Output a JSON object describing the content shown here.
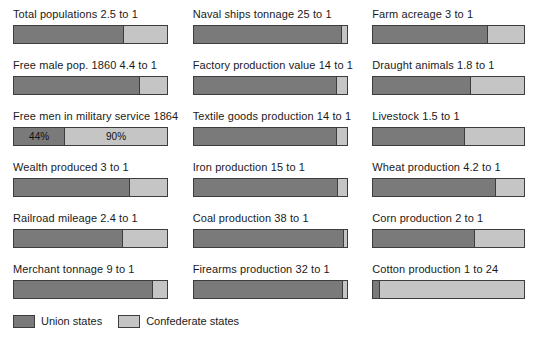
{
  "chart_data": {
    "type": "bar",
    "title": "",
    "subtitle": "",
    "xlabel": "",
    "ylabel": "",
    "orientation": "horizontal-stacked",
    "grid": false,
    "legend_position": "bottom-left",
    "legend": [
      {
        "key": "union",
        "label": "Union states",
        "color": "#7a7a7a"
      },
      {
        "key": "confederate",
        "label": "Confederate states",
        "color": "#c5c5c5"
      }
    ],
    "series": [
      {
        "name": "Union states",
        "color": "#7a7a7a"
      },
      {
        "name": "Confederate states",
        "color": "#c5c5c5"
      }
    ],
    "categories": [
      "Total populations 2.5 to 1",
      "Free male pop. 1860 4.4 to 1",
      "Free men in military service 1864",
      "Wealth produced 3 to 1",
      "Railroad mileage 2.4 to 1",
      "Merchant tonnage 9 to 1",
      "Naval ships tonnage 25 to 1",
      "Factory production value 14 to 1",
      "Textile goods production 14 to 1",
      "Iron production 15 to 1",
      "Coal production 38 to 1",
      "Firearms production 32 to 1",
      "Farm acreage 3 to 1",
      "Draught animals 1.8 to 1",
      "Livestock 1.5 to 1",
      "Wheat production 4.2 to 1",
      "Corn production 2 to 1",
      "Cotton production 1 to 24"
    ],
    "columns": [
      {
        "index": 0,
        "panels": [
          {
            "label": "Total populations 2.5 to 1",
            "ratio_union": 2.5,
            "ratio_confederate": 1,
            "union_pct": 71.4,
            "confederate_pct": 28.6,
            "union_seg_label": "",
            "confederate_seg_label": ""
          },
          {
            "label": "Free male pop. 1860 4.4 to 1",
            "ratio_union": 4.4,
            "ratio_confederate": 1,
            "union_pct": 81.5,
            "confederate_pct": 18.5,
            "union_seg_label": "",
            "confederate_seg_label": ""
          },
          {
            "label": "Free men in military service 1864",
            "ratio_union": null,
            "ratio_confederate": null,
            "union_pct": 32.8,
            "confederate_pct": 67.2,
            "union_seg_label": "44%",
            "confederate_seg_label": "90%"
          },
          {
            "label": "Wealth produced 3 to 1",
            "ratio_union": 3,
            "ratio_confederate": 1,
            "union_pct": 75.0,
            "confederate_pct": 25.0,
            "union_seg_label": "",
            "confederate_seg_label": ""
          },
          {
            "label": "Railroad mileage 2.4 to 1",
            "ratio_union": 2.4,
            "ratio_confederate": 1,
            "union_pct": 70.6,
            "confederate_pct": 29.4,
            "union_seg_label": "",
            "confederate_seg_label": ""
          },
          {
            "label": "Merchant tonnage 9 to 1",
            "ratio_union": 9,
            "ratio_confederate": 1,
            "union_pct": 90.0,
            "confederate_pct": 10.0,
            "union_seg_label": "",
            "confederate_seg_label": ""
          }
        ]
      },
      {
        "index": 1,
        "panels": [
          {
            "label": "Naval ships tonnage 25 to 1",
            "ratio_union": 25,
            "ratio_confederate": 1,
            "union_pct": 96.2,
            "confederate_pct": 3.8,
            "union_seg_label": "",
            "confederate_seg_label": ""
          },
          {
            "label": "Factory production value 14 to 1",
            "ratio_union": 14,
            "ratio_confederate": 1,
            "union_pct": 93.3,
            "confederate_pct": 6.7,
            "union_seg_label": "",
            "confederate_seg_label": ""
          },
          {
            "label": "Textile goods production 14 to 1",
            "ratio_union": 14,
            "ratio_confederate": 1,
            "union_pct": 93.3,
            "confederate_pct": 6.7,
            "union_seg_label": "",
            "confederate_seg_label": ""
          },
          {
            "label": "Iron production 15 to 1",
            "ratio_union": 15,
            "ratio_confederate": 1,
            "union_pct": 93.8,
            "confederate_pct": 6.2,
            "union_seg_label": "",
            "confederate_seg_label": ""
          },
          {
            "label": "Coal production 38 to 1",
            "ratio_union": 38,
            "ratio_confederate": 1,
            "union_pct": 97.4,
            "confederate_pct": 2.6,
            "union_seg_label": "",
            "confederate_seg_label": ""
          },
          {
            "label": "Firearms production 32 to 1",
            "ratio_union": 32,
            "ratio_confederate": 1,
            "union_pct": 97.0,
            "confederate_pct": 3.0,
            "union_seg_label": "",
            "confederate_seg_label": ""
          }
        ]
      },
      {
        "index": 2,
        "panels": [
          {
            "label": "Farm acreage 3 to 1",
            "ratio_union": 3,
            "ratio_confederate": 1,
            "union_pct": 75.0,
            "confederate_pct": 25.0,
            "union_seg_label": "",
            "confederate_seg_label": ""
          },
          {
            "label": "Draught animals 1.8 to 1",
            "ratio_union": 1.8,
            "ratio_confederate": 1,
            "union_pct": 64.3,
            "confederate_pct": 35.7,
            "union_seg_label": "",
            "confederate_seg_label": ""
          },
          {
            "label": "Livestock 1.5 to 1",
            "ratio_union": 1.5,
            "ratio_confederate": 1,
            "union_pct": 60.0,
            "confederate_pct": 40.0,
            "union_seg_label": "",
            "confederate_seg_label": ""
          },
          {
            "label": "Wheat production 4.2 to 1",
            "ratio_union": 4.2,
            "ratio_confederate": 1,
            "union_pct": 80.8,
            "confederate_pct": 19.2,
            "union_seg_label": "",
            "confederate_seg_label": ""
          },
          {
            "label": "Corn production 2 to 1",
            "ratio_union": 2,
            "ratio_confederate": 1,
            "union_pct": 66.7,
            "confederate_pct": 33.3,
            "union_seg_label": "",
            "confederate_seg_label": ""
          },
          {
            "label": "Cotton production 1 to 24",
            "ratio_union": 1,
            "ratio_confederate": 24,
            "union_pct": 4.0,
            "confederate_pct": 96.0,
            "union_seg_label": "",
            "confederate_seg_label": ""
          }
        ]
      }
    ]
  }
}
